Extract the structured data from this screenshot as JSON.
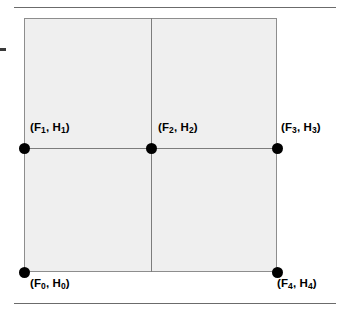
{
  "figure": {
    "title": "",
    "background_color": "#ffffff",
    "rules": {
      "top_label": "top-horizontal-rule",
      "bottom_label": "bottom-horizontal-rule",
      "color": "#6b6b6b"
    },
    "square": {
      "fill_color": "#efefef",
      "stroke_color": "#8d8d8d",
      "median_color": "#7c7c7c"
    },
    "nodes": [
      {
        "id": "F0",
        "label": "(F",
        "sub1": "0",
        "mid": ", H",
        "sub2": "0",
        "close": ")",
        "position": "bottom-left"
      },
      {
        "id": "F1",
        "label": "(F",
        "sub1": "1",
        "mid": ", H",
        "sub2": "1",
        "close": ")",
        "position": "middle-left"
      },
      {
        "id": "F2",
        "label": "(F",
        "sub1": "2",
        "mid": ", H",
        "sub2": "2",
        "close": ")",
        "position": "center"
      },
      {
        "id": "F3",
        "label": "(F",
        "sub1": "3",
        "mid": ", H",
        "sub2": "3",
        "close": ")",
        "position": "middle-right"
      },
      {
        "id": "F4",
        "label": "(F",
        "sub1": "4",
        "mid": ", H",
        "sub2": "4",
        "close": ")",
        "position": "bottom-right"
      }
    ]
  }
}
